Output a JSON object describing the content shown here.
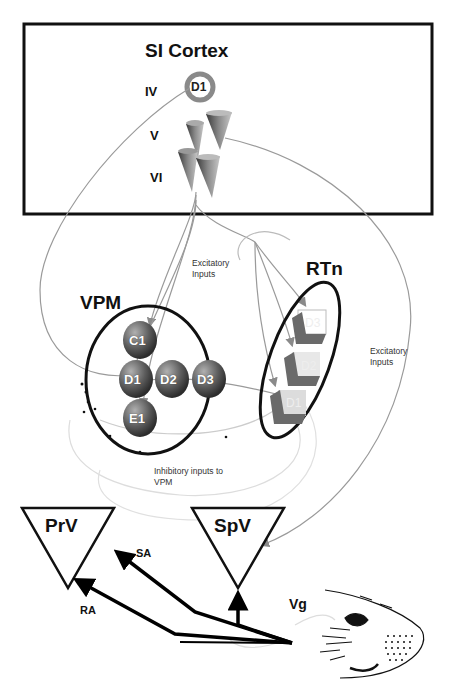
{
  "cortex": {
    "title": "SI Cortex",
    "layers": [
      "IV",
      "V",
      "VI"
    ],
    "layer4_cell": "D1"
  },
  "vpm": {
    "title": "VPM",
    "barreloids": [
      "C1",
      "D1",
      "D2",
      "D3",
      "E1"
    ]
  },
  "rtn": {
    "title": "RTn",
    "cells": [
      "D3",
      "D2",
      "D1"
    ]
  },
  "annotations": {
    "excitatory_center": "Excitatory Inputs",
    "excitatory_right": "Excitatory Inputs",
    "inhibitory": "Inhibitory inputs to VPM"
  },
  "brainstem": {
    "prv": "PrV",
    "spv": "SpV",
    "ganglion": "Vg",
    "pathway_sa": "SA",
    "pathway_ra": "RA"
  },
  "whisker_pad": {
    "row_labels": [
      "A",
      "B",
      "C",
      "D",
      "E"
    ],
    "arc_labels": [
      "1",
      "2",
      "3",
      "4",
      "5"
    ]
  },
  "colors": {
    "outline": "#111111",
    "projection_line": "#9a9a9a",
    "cell_fill": "#6f6f6f",
    "background": "#ffffff"
  }
}
